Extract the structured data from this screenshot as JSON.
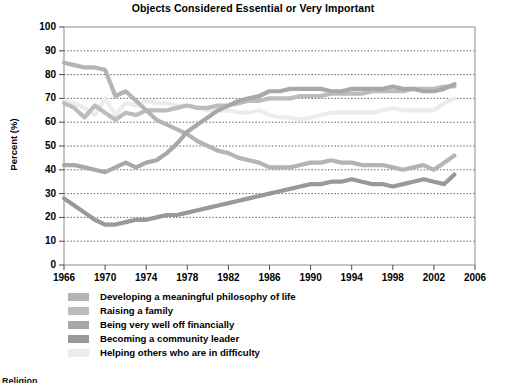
{
  "chart_data": {
    "type": "line",
    "title": "Objects Considered Essential or Very Important",
    "xlabel": "",
    "ylabel": "Percent (%)",
    "xlim": [
      1966,
      2006
    ],
    "ylim": [
      0,
      100
    ],
    "xticks": [
      1966,
      1970,
      1974,
      1978,
      1982,
      1986,
      1990,
      1994,
      1998,
      2002,
      2006
    ],
    "yticks": [
      0,
      10,
      20,
      30,
      40,
      50,
      60,
      70,
      80,
      90,
      100
    ],
    "grid": "horizontal-dotted",
    "legend_position": "below-plot-left",
    "x": [
      1966,
      1967,
      1968,
      1969,
      1970,
      1971,
      1972,
      1973,
      1974,
      1975,
      1976,
      1977,
      1978,
      1979,
      1980,
      1981,
      1982,
      1983,
      1984,
      1985,
      1986,
      1987,
      1988,
      1989,
      1990,
      1991,
      1992,
      1993,
      1994,
      1995,
      1996,
      1997,
      1998,
      1999,
      2000,
      2001,
      2002,
      2003,
      2004
    ],
    "series": [
      {
        "name": "Developing a meaningful philosophy of life",
        "color": "#b4b4b4",
        "values": [
          85,
          84,
          83,
          83,
          82,
          71,
          73,
          69,
          65,
          61,
          59,
          57,
          55,
          52,
          50,
          48,
          47,
          45,
          44,
          43,
          41,
          41,
          41,
          42,
          43,
          43,
          44,
          43,
          43,
          42,
          42,
          42,
          41,
          40,
          41,
          42,
          40,
          43,
          46
        ]
      },
      {
        "name": "Raising a family",
        "color": "#bcbcbc",
        "values": [
          68,
          66,
          62,
          67,
          64,
          61,
          64,
          63,
          65,
          65,
          65,
          66,
          67,
          66,
          66,
          67,
          67,
          68,
          69,
          69,
          70,
          70,
          70,
          71,
          71,
          71,
          72,
          72,
          72,
          72,
          73,
          73,
          73,
          73,
          74,
          74,
          74,
          75,
          75
        ]
      },
      {
        "name": "Being very well off financially",
        "color": "#a8a8a8",
        "values": [
          42,
          42,
          41,
          40,
          39,
          41,
          43,
          41,
          43,
          44,
          47,
          51,
          56,
          59,
          62,
          65,
          67,
          69,
          70,
          71,
          73,
          73,
          74,
          74,
          74,
          74,
          73,
          73,
          74,
          74,
          74,
          74,
          75,
          74,
          74,
          73,
          73,
          74,
          76
        ]
      },
      {
        "name": "Becoming a community leader",
        "color": "#999999",
        "values": [
          28,
          25,
          22,
          19,
          17,
          17,
          18,
          19,
          19,
          20,
          21,
          21,
          22,
          23,
          24,
          25,
          26,
          27,
          28,
          29,
          30,
          31,
          32,
          33,
          34,
          34,
          35,
          35,
          36,
          35,
          34,
          34,
          33,
          34,
          35,
          36,
          35,
          34,
          38
        ]
      },
      {
        "name": "Helping others who are in difficulty",
        "color": "#ececec",
        "values": [
          69,
          68,
          66,
          63,
          70,
          63,
          68,
          67,
          69,
          68,
          68,
          67,
          67,
          66,
          65,
          65,
          65,
          64,
          64,
          65,
          63,
          62,
          62,
          61,
          62,
          63,
          64,
          64,
          64,
          64,
          64,
          65,
          66,
          65,
          65,
          65,
          65,
          68,
          70
        ]
      }
    ]
  },
  "axis": {
    "y_title": "Percent (%)",
    "y_labels": [
      "100",
      "90",
      "80",
      "70",
      "60",
      "50",
      "40",
      "30",
      "20",
      "10",
      "0"
    ],
    "x_labels": [
      "1966",
      "1970",
      "1974",
      "1978",
      "1982",
      "1986",
      "1990",
      "1994",
      "1998",
      "2002",
      "2006"
    ]
  },
  "legend": {
    "items": [
      {
        "label": "Developing a meaningful philosophy of life",
        "color": "#b4b4b4"
      },
      {
        "label": "Raising a family",
        "color": "#bcbcbc"
      },
      {
        "label": "Being very well off financially",
        "color": "#a8a8a8"
      },
      {
        "label": "Becoming a community leader",
        "color": "#999999"
      },
      {
        "label": "Helping others who are in difficulty",
        "color": "#ececec"
      }
    ]
  },
  "footer": {
    "clipped_text": "Religion"
  }
}
